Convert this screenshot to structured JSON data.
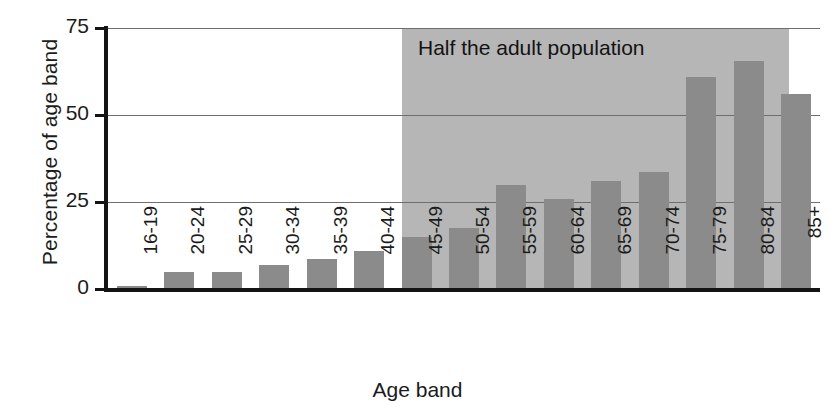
{
  "chart_data": {
    "type": "bar",
    "title": "",
    "xlabel": "Age band",
    "ylabel": "Percentage of age band",
    "categories": [
      "16-19",
      "20-24",
      "25-29",
      "30-34",
      "35-39",
      "40-44",
      "45-49",
      "50-54",
      "55-59",
      "60-64",
      "65-69",
      "70-74",
      "75-79",
      "80-84",
      "85+"
    ],
    "values": [
      1,
      5,
      5,
      7,
      8.5,
      11,
      15,
      17.5,
      30,
      26,
      31,
      33.5,
      61,
      65.5,
      56
    ],
    "ylim": [
      0,
      75
    ],
    "yticks": [
      0,
      25,
      50,
      75
    ],
    "ytick_labels": [
      "0",
      "25",
      "50",
      "75"
    ],
    "grid": true,
    "grid_axis": "y",
    "legend": "none",
    "annotations": [
      {
        "text": "Half the adult population",
        "region_start_category": "45-49",
        "region_end_category": "85+"
      }
    ],
    "series": [
      {
        "name": "Percentage of age band",
        "values": [
          1,
          5,
          5,
          7,
          8.5,
          11,
          15,
          17.5,
          30,
          26,
          31,
          33.5,
          61,
          65.5,
          56
        ]
      }
    ],
    "colors": {
      "bar": "#8b8b8b",
      "shaded_region": "#b6b6b6",
      "axis": "#141414",
      "gridline": "#6e6e6e",
      "text": "#1b1b1b",
      "background": "#ffffff"
    }
  }
}
